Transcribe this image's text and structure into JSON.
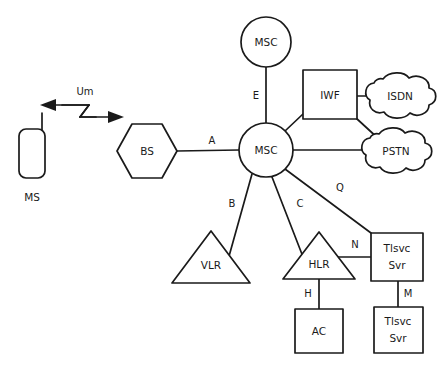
{
  "diagram": {
    "background_color": "#ffffff",
    "stroke_color": "#1a1a1a",
    "nodes": [
      {
        "id": "ms",
        "label": "MS",
        "shape": "mobile-handset",
        "cx": 32,
        "cy": 148
      },
      {
        "id": "bs",
        "label": "BS",
        "shape": "hexagon",
        "cx": 147,
        "cy": 151
      },
      {
        "id": "msc_hub",
        "label": "MSC",
        "shape": "circle",
        "cx": 266,
        "cy": 150
      },
      {
        "id": "msc_top",
        "label": "MSC",
        "shape": "circle",
        "cx": 266,
        "cy": 42
      },
      {
        "id": "iwf",
        "label": "IWF",
        "shape": "rectangle",
        "cx": 330,
        "cy": 96
      },
      {
        "id": "isdn",
        "label": "ISDN",
        "shape": "cloud",
        "cx": 398,
        "cy": 96
      },
      {
        "id": "pstn",
        "label": "PSTN",
        "shape": "cloud",
        "cx": 394,
        "cy": 151
      },
      {
        "id": "vlr",
        "label": "VLR",
        "shape": "triangle",
        "cx": 211,
        "cy": 255
      },
      {
        "id": "hlr",
        "label": "HLR",
        "shape": "triangle",
        "cx": 319,
        "cy": 255
      },
      {
        "id": "ac",
        "label": "AC",
        "shape": "rectangle",
        "cx": 319,
        "cy": 328
      },
      {
        "id": "tlsvc_1",
        "label": "Tlsvc Svr",
        "line1": "Tlsvc",
        "line2": "Svr",
        "shape": "rectangle",
        "cx": 398,
        "cy": 256
      },
      {
        "id": "tlsvc_2",
        "label": "Tlsvc Svr",
        "line1": "Tlsvc",
        "line2": "Svr",
        "shape": "rectangle",
        "cx": 398,
        "cy": 330
      }
    ],
    "interfaces": [
      {
        "id": "um",
        "label": "Um",
        "from": "ms",
        "to": "bs",
        "style": "radio-zigzag-double-arrow"
      },
      {
        "id": "a",
        "label": "A",
        "from": "bs",
        "to": "msc_hub",
        "style": "line"
      },
      {
        "id": "e",
        "label": "E",
        "from": "msc_top",
        "to": "msc_hub",
        "style": "line"
      },
      {
        "id": "b",
        "label": "B",
        "from": "msc_hub",
        "to": "vlr",
        "style": "line"
      },
      {
        "id": "c",
        "label": "C",
        "from": "msc_hub",
        "to": "hlr",
        "style": "line"
      },
      {
        "id": "q",
        "label": "Q",
        "from": "msc_hub",
        "to": "tlsvc_1",
        "style": "line"
      },
      {
        "id": "n",
        "label": "N",
        "from": "hlr",
        "to": "tlsvc_1",
        "style": "line"
      },
      {
        "id": "h",
        "label": "H",
        "from": "hlr",
        "to": "ac",
        "style": "line"
      },
      {
        "id": "m",
        "label": "M",
        "from": "tlsvc_1",
        "to": "tlsvc_2",
        "style": "line"
      },
      {
        "id": "iwf_msc",
        "label": "",
        "from": "msc_hub",
        "to": "iwf",
        "style": "line"
      },
      {
        "id": "iwf_isdn",
        "label": "",
        "from": "iwf",
        "to": "isdn",
        "style": "line"
      },
      {
        "id": "iwf_pstn",
        "label": "",
        "from": "iwf",
        "to": "pstn",
        "style": "line"
      },
      {
        "id": "msc_pstn",
        "label": "",
        "from": "msc_hub",
        "to": "pstn",
        "style": "line"
      }
    ]
  }
}
